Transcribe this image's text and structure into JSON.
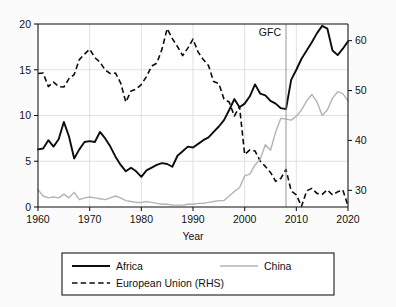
{
  "chart_data": {
    "type": "line",
    "title": "",
    "xlabel": "Year",
    "ylabel": "",
    "xlim": [
      1960,
      2020
    ],
    "ylim": [
      0,
      20
    ],
    "y2lim": [
      26.67,
      63.33
    ],
    "grid": true,
    "legend_position": "below-plot",
    "x_ticks": [
      1960,
      1970,
      1980,
      1990,
      2000,
      2010,
      2020
    ],
    "x_tick_labels": [
      "1960",
      "1970",
      "1980",
      "1990",
      "2000",
      "2010",
      "2020"
    ],
    "y_ticks": [
      0,
      5,
      10,
      15,
      20
    ],
    "y_tick_labels": [
      "0",
      "5",
      "10",
      "15",
      "20"
    ],
    "y2_ticks": [
      30,
      40,
      50,
      60
    ],
    "y2_tick_labels": [
      "30",
      "40",
      "50",
      "60"
    ],
    "annotations": [
      {
        "label": "GFC",
        "x": 2008,
        "type": "vertical-line"
      }
    ],
    "x": [
      1960,
      1961,
      1962,
      1963,
      1964,
      1965,
      1966,
      1967,
      1968,
      1969,
      1970,
      1971,
      1972,
      1973,
      1974,
      1975,
      1976,
      1977,
      1978,
      1979,
      1980,
      1981,
      1982,
      1983,
      1984,
      1985,
      1986,
      1987,
      1988,
      1989,
      1990,
      1991,
      1992,
      1993,
      1994,
      1995,
      1996,
      1997,
      1998,
      1999,
      2000,
      2001,
      2002,
      2003,
      2004,
      2005,
      2006,
      2007,
      2008,
      2009,
      2010,
      2011,
      2012,
      2013,
      2014,
      2015,
      2016,
      2017,
      2018,
      2019,
      2020
    ],
    "series": [
      {
        "name": "Africa",
        "axis": "left",
        "style": "solid",
        "color": "#0d0d0d",
        "values": [
          6.3,
          6.4,
          7.3,
          6.6,
          7.4,
          9.3,
          7.7,
          5.3,
          6.3,
          7.1,
          7.2,
          7.1,
          8.2,
          7.5,
          6.6,
          5.5,
          4.6,
          3.9,
          4.3,
          3.9,
          3.3,
          4.0,
          4.3,
          4.6,
          4.8,
          4.7,
          4.4,
          5.6,
          6.1,
          6.6,
          6.5,
          6.9,
          7.3,
          7.6,
          8.2,
          8.8,
          9.5,
          10.6,
          11.8,
          10.9,
          11.3,
          12.1,
          13.4,
          12.4,
          12.2,
          11.6,
          11.3,
          10.8,
          10.7,
          13.9,
          15.0,
          16.2,
          17.1,
          18.0,
          19.0,
          19.8,
          19.5,
          17.1,
          16.6,
          17.3,
          18.1
        ]
      },
      {
        "name": "European Union (RHS)",
        "axis": "right",
        "style": "dashed",
        "color": "#0d0d0d",
        "values": [
          53.4,
          53.5,
          50.8,
          51.7,
          50.8,
          50.7,
          52.4,
          53.2,
          56.2,
          57.3,
          58.3,
          56.6,
          55.7,
          54.1,
          53.4,
          53.5,
          51.5,
          47.7,
          49.9,
          50.3,
          51.2,
          52.8,
          54.9,
          55.5,
          58.3,
          62.4,
          60.4,
          58.8,
          57.0,
          58.5,
          60.3,
          57.7,
          56.2,
          55.0,
          51.8,
          51.4,
          48.3,
          47.7,
          44.9,
          46.8,
          37.2,
          38.1,
          37.9,
          35.9,
          34.8,
          33.6,
          31.8,
          32.4,
          34.2,
          29.9,
          29.1,
          26.8,
          29.9,
          30.4,
          29.4,
          29.2,
          30.1,
          29.1,
          29.7,
          30.1,
          26.9
        ]
      },
      {
        "name": "China",
        "axis": "left",
        "style": "solid",
        "color": "#b4b4b8",
        "values": [
          1.9,
          1.2,
          1.0,
          1.1,
          1.0,
          1.4,
          1.0,
          1.6,
          0.8,
          1.0,
          1.1,
          1.0,
          0.9,
          0.8,
          1.0,
          1.2,
          1.0,
          0.7,
          0.6,
          0.5,
          0.5,
          0.6,
          0.5,
          0.4,
          0.3,
          0.3,
          0.2,
          0.2,
          0.2,
          0.3,
          0.3,
          0.4,
          0.4,
          0.5,
          0.6,
          0.7,
          0.7,
          1.2,
          1.7,
          2.1,
          3.4,
          3.6,
          4.6,
          5.2,
          6.8,
          6.2,
          8.2,
          9.7,
          9.6,
          9.5,
          9.9,
          10.6,
          11.6,
          12.3,
          11.5,
          10.0,
          10.6,
          11.9,
          12.6,
          12.4,
          11.6
        ]
      }
    ],
    "legend_entries": [
      {
        "label": "Africa",
        "style": "solid",
        "color": "#0d0d0d"
      },
      {
        "label": "European Union (RHS)",
        "style": "dashed",
        "color": "#0d0d0d"
      },
      {
        "label": "China",
        "style": "solid",
        "color": "#b4b4b8"
      }
    ]
  }
}
